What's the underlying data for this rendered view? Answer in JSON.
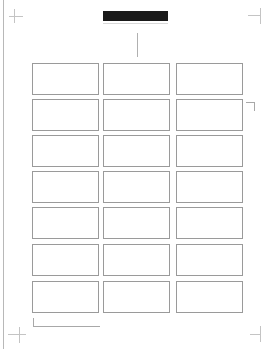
{
  "page": {
    "type": "blank label sheet",
    "background": "#ffffff"
  },
  "header": {
    "bar_color": "#1a1a1a"
  },
  "label_grid": {
    "columns": 3,
    "rows": 7,
    "border_color": "#9a9a9a",
    "column_x": [
      32,
      103,
      176
    ],
    "row_y": [
      63,
      99,
      135,
      171,
      207,
      244,
      281
    ],
    "label_width": 67,
    "label_height": 32
  },
  "marks": {
    "crop_marks": [
      "top-left",
      "top-right",
      "bottom-left",
      "bottom-right"
    ],
    "corner_bracket_right": true,
    "bottom_bracket_left": true,
    "center_tick": true
  }
}
